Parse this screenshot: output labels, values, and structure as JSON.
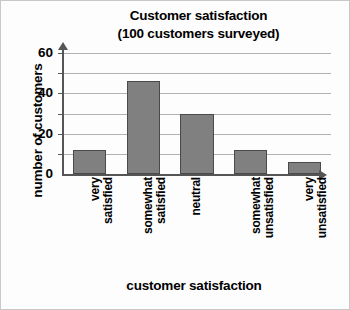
{
  "chart_data": {
    "type": "bar",
    "title": "Customer satisfaction",
    "subtitle": "(100 customers surveyed)",
    "xlabel": "customer satisfaction",
    "ylabel": "number of customers",
    "categories": [
      "very satisfied",
      "somewhat satisfied",
      "neutral",
      "somewhat unsatisfied",
      "very unsatisfied"
    ],
    "category_lines": [
      [
        "very",
        "satisfied"
      ],
      [
        "somewhat",
        "satisfied"
      ],
      [
        "neutral"
      ],
      [
        "somewhat",
        "unsatisfied"
      ],
      [
        "very",
        "unsatisfied"
      ]
    ],
    "values": [
      12,
      46,
      30,
      12,
      6
    ],
    "ylim": [
      0,
      60
    ],
    "ytick_labels": [
      "0",
      "20",
      "40",
      "60"
    ],
    "ytick_values": [
      0,
      20,
      40,
      60
    ],
    "gridline_values": [
      10,
      20,
      30,
      40,
      50,
      60
    ],
    "grid": true,
    "legend": "none",
    "bar_color": "#808080",
    "bar_border_color": "#4a4a4a",
    "grid_color": "#b2b2b2",
    "axis_color": "#555555"
  }
}
